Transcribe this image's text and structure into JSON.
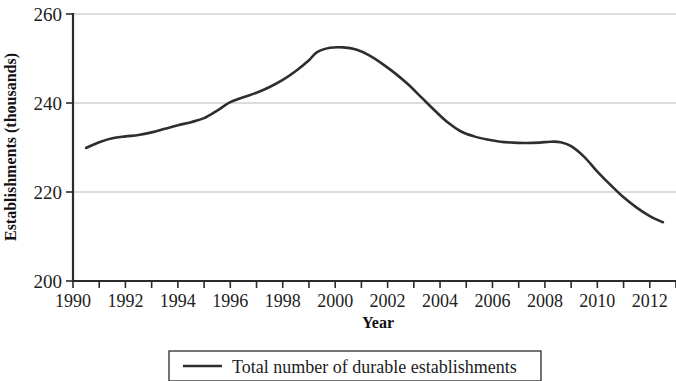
{
  "chart_data": {
    "type": "line",
    "title": "",
    "xlabel": "Year",
    "ylabel": "Establishments (thousands)",
    "xlim": [
      1990,
      2013
    ],
    "ylim": [
      200,
      260
    ],
    "yticks": [
      200,
      220,
      240,
      260
    ],
    "ytick_labels": [
      "200",
      "220",
      "240",
      "260"
    ],
    "xticks": [
      1990,
      1992,
      1994,
      1996,
      1998,
      2000,
      2002,
      2004,
      2006,
      2008,
      2010,
      2012
    ],
    "xtick_labels": [
      "1990",
      "1992",
      "1994",
      "1996",
      "1998",
      "2000",
      "2002",
      "2004",
      "2006",
      "2008",
      "2010",
      "2012"
    ],
    "x_minor_tick_step": 1,
    "grid": "horizontal",
    "grid_color": "#b9b9b9",
    "legend_position": "bottom-center",
    "legend": [
      "Total number of durable establishments"
    ],
    "series": [
      {
        "name": "Total number of durable establishments",
        "color": "#2e2e2e",
        "x": [
          1990.5,
          1991.0,
          1991.5,
          1992.0,
          1992.5,
          1993.0,
          1993.5,
          1994.0,
          1994.5,
          1995.0,
          1995.5,
          1996.0,
          1996.5,
          1997.0,
          1997.5,
          1998.0,
          1998.5,
          1999.0,
          1999.3,
          1999.8,
          2000.3,
          2000.8,
          2001.3,
          2001.8,
          2002.3,
          2002.8,
          2003.3,
          2003.8,
          2004.3,
          2004.8,
          2005.3,
          2005.8,
          2006.3,
          2006.8,
          2007.3,
          2007.8,
          2008.2,
          2008.6,
          2009.0,
          2009.5,
          2010.0,
          2010.5,
          2011.0,
          2011.5,
          2012.0,
          2012.5
        ],
        "values": [
          229.9,
          231.2,
          232.1,
          232.5,
          232.8,
          233.4,
          234.2,
          235.0,
          235.7,
          236.6,
          238.3,
          240.2,
          241.3,
          242.3,
          243.6,
          245.2,
          247.2,
          249.6,
          251.4,
          252.4,
          252.5,
          252.0,
          250.7,
          248.8,
          246.6,
          244.1,
          241.2,
          238.3,
          235.6,
          233.6,
          232.5,
          231.8,
          231.3,
          231.1,
          231.0,
          231.1,
          231.3,
          231.2,
          230.3,
          227.9,
          224.6,
          221.6,
          218.8,
          216.5,
          214.6,
          213.2
        ]
      }
    ],
    "notes": {
      "peak_year": "1999-2000",
      "peak_value": 252.5,
      "start_value": 229.9,
      "end_value": 213.2
    }
  },
  "axes": {
    "y_axis_title": "Establishments (thousands)",
    "x_axis_title": "Year"
  },
  "legend": {
    "entries": [
      {
        "label": "Total number of durable establishments",
        "marker": "line-swatch"
      }
    ]
  }
}
